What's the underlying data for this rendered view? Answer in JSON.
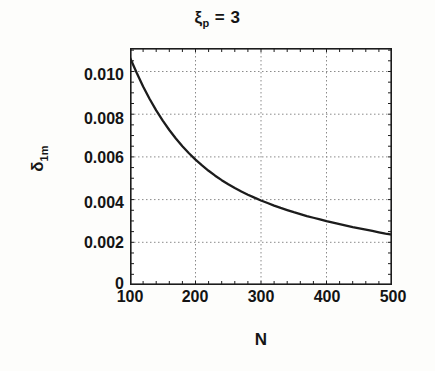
{
  "figure": {
    "title_symbol": "ξ",
    "title_subscript": "p",
    "title_equals": "= 3",
    "title_full": "ξp = 3",
    "background_color": "#fdfdfb",
    "line_color": "#1c1c1c",
    "grid_color": "#8a8a8a",
    "axis_color": "#1c1c1c"
  },
  "axes": {
    "ylabel_symbol": "δ",
    "ylabel_subscript": "1m",
    "ylabel_full": "δ1m",
    "xlabel": "N",
    "xticks": [
      "100",
      "200",
      "300",
      "400",
      "500"
    ],
    "yticks": [
      "0",
      "0.002",
      "0.004",
      "0.006",
      "0.008",
      "0.010"
    ]
  },
  "chart_data": {
    "type": "line",
    "xlabel": "N",
    "ylabel": "δ1m",
    "xlim": [
      100,
      500
    ],
    "ylim": [
      0,
      0.0111
    ],
    "xticks": [
      100,
      200,
      300,
      400,
      500
    ],
    "yticks": [
      0,
      0.002,
      0.004,
      0.006,
      0.008,
      0.01
    ],
    "grid": true,
    "grid_style": "dotted",
    "legend": null,
    "series": [
      {
        "name": "delta_1m",
        "x": [
          100,
          110,
          120,
          130,
          140,
          150,
          160,
          170,
          180,
          190,
          200,
          210,
          220,
          230,
          240,
          250,
          260,
          270,
          280,
          290,
          300,
          310,
          320,
          330,
          340,
          350,
          360,
          370,
          380,
          390,
          400,
          410,
          420,
          430,
          440,
          450,
          460,
          470,
          480,
          490,
          500
        ],
        "y": [
          0.01065,
          0.00995,
          0.0093,
          0.00871,
          0.00818,
          0.0077,
          0.00726,
          0.00686,
          0.0065,
          0.00617,
          0.00587,
          0.0056,
          0.00535,
          0.00512,
          0.00491,
          0.00472,
          0.00454,
          0.00438,
          0.00423,
          0.00409,
          0.00396,
          0.00384,
          0.00372,
          0.00361,
          0.00351,
          0.00341,
          0.00332,
          0.00323,
          0.00315,
          0.00307,
          0.00299,
          0.00292,
          0.00285,
          0.00278,
          0.00271,
          0.00265,
          0.00259,
          0.00253,
          0.00247,
          0.00241,
          0.00236
        ]
      }
    ]
  }
}
